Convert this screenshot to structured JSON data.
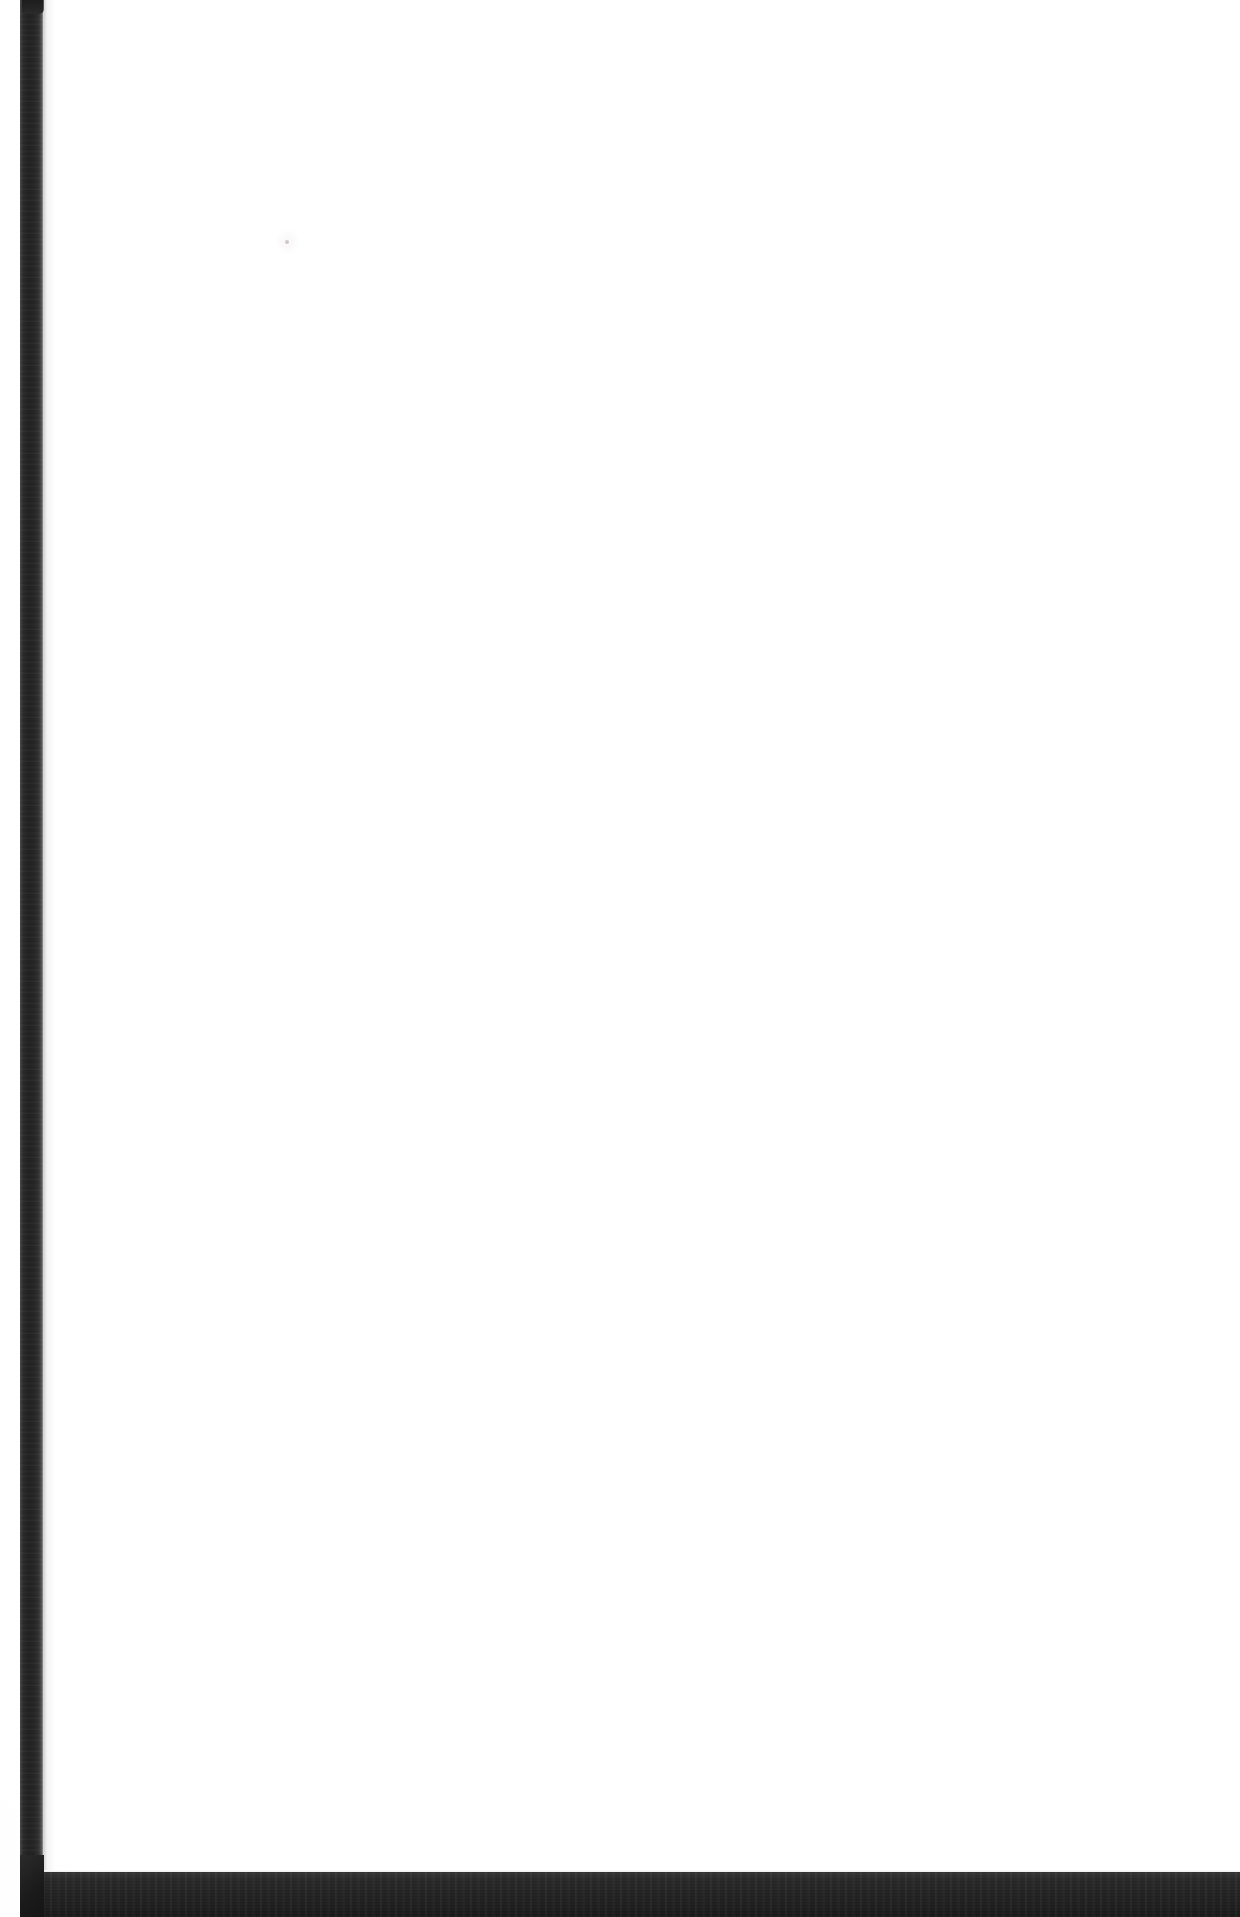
{
  "document": {
    "kind": "scanned-page",
    "title": "Scanned blank page",
    "page_content_text": "",
    "is_blank": true,
    "width_px": 1240,
    "height_px": 1917
  },
  "colors": {
    "paper": "#ffffff",
    "spine_dark": "#222222",
    "spine_edge_light": "#9a9a9a",
    "bottom_band": "#1f1f1f",
    "artifact_speck": "#b2aaaa"
  },
  "regions": {
    "paper_label": "",
    "spine_label": "",
    "bottom_band_label": "",
    "artifact_label": ""
  }
}
